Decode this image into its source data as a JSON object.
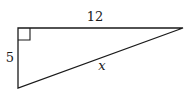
{
  "diagram": {
    "type": "right-triangle",
    "stroke_color": "#1a1a1a",
    "vertices": {
      "right_angle": [
        18,
        28
      ],
      "top_right": [
        183,
        28
      ],
      "bottom_left": [
        18,
        88
      ]
    },
    "right_angle_marker_size": 12,
    "labels": {
      "top_side": "12",
      "left_side": "5",
      "hypotenuse": "x"
    }
  }
}
